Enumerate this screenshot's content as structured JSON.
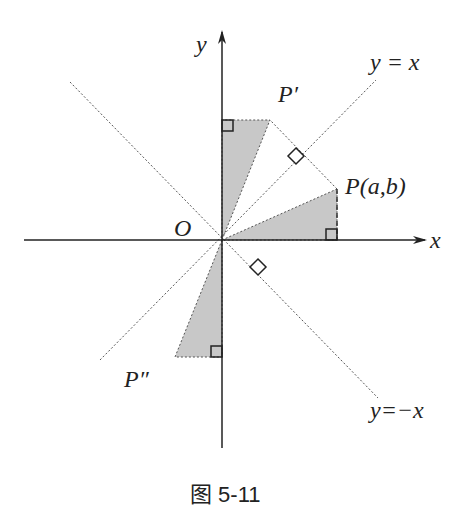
{
  "figure": {
    "caption": "图 5-11",
    "labels": {
      "y_axis": "y",
      "x_axis": "x",
      "origin": "O",
      "point_p": "P(a,b)",
      "point_p_prime": "P′",
      "point_p_double_prime": "P″",
      "line_y_eq_x": "y = x",
      "line_y_eq_neg_x": "y=−x"
    },
    "colors": {
      "axis": "#222222",
      "shade": "#c8c8c8",
      "dotted": "#555555"
    },
    "points": {
      "origin": [
        222,
        240
      ],
      "P": [
        337,
        189
      ],
      "P_prime": [
        270,
        120
      ],
      "P_double_prime": [
        175,
        357
      ]
    }
  }
}
